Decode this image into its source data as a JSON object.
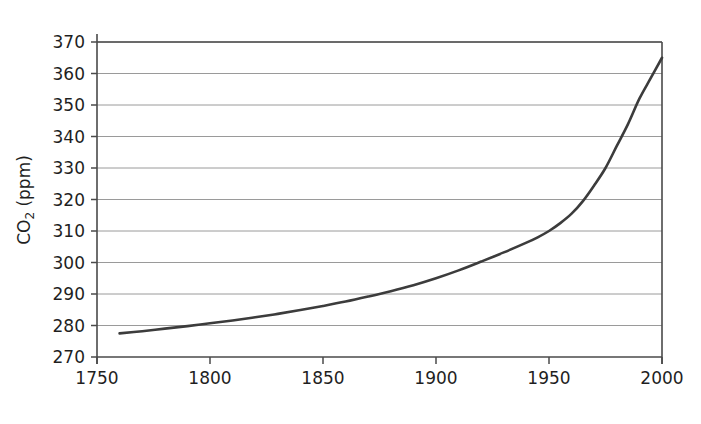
{
  "chart_data": {
    "type": "line",
    "title": "",
    "xlabel": "",
    "ylabel": "CO2 (ppm)",
    "ylabel_parts": {
      "base": "CO",
      "subscript": "2",
      "unit": " (ppm)"
    },
    "xlim": [
      1750,
      2000
    ],
    "ylim": [
      270,
      370
    ],
    "xticks": [
      1750,
      1800,
      1850,
      1900,
      1950,
      2000
    ],
    "yticks": [
      270,
      280,
      290,
      300,
      310,
      320,
      330,
      340,
      350,
      360,
      370
    ],
    "xtick_labels": [
      "1750",
      "1800",
      "1850",
      "1900",
      "1950",
      "2000"
    ],
    "ytick_labels": [
      "270",
      "280",
      "290",
      "300",
      "310",
      "320",
      "330",
      "340",
      "350",
      "360",
      "370"
    ],
    "grid": "horizontal",
    "legend": "none",
    "series": [
      {
        "name": "Atmospheric CO2 concentration",
        "x": [
          1760,
          1770,
          1780,
          1790,
          1800,
          1810,
          1820,
          1830,
          1840,
          1850,
          1860,
          1870,
          1880,
          1890,
          1900,
          1910,
          1920,
          1930,
          1940,
          1945,
          1950,
          1955,
          1960,
          1965,
          1970,
          1975,
          1980,
          1985,
          1990,
          1995,
          2000
        ],
        "y": [
          277.5,
          278.2,
          279.0,
          279.8,
          280.7,
          281.6,
          282.6,
          283.7,
          284.9,
          286.2,
          287.6,
          289.2,
          290.9,
          292.8,
          295.0,
          297.5,
          300.3,
          303.2,
          306.3,
          308.0,
          310.0,
          312.5,
          315.5,
          319.5,
          324.5,
          330.0,
          337.0,
          344.0,
          352.0,
          358.5,
          365.0
        ]
      }
    ]
  },
  "colors": {
    "background": "#ffffff",
    "line": "#3c3c3c",
    "axis": "#4a4a4a",
    "grid": "#8e8e8e",
    "text": "#1f1f1f"
  }
}
